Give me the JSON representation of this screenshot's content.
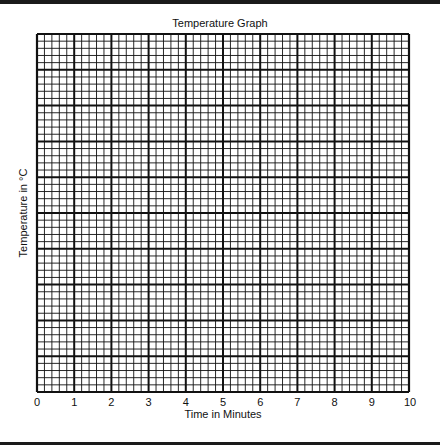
{
  "chart_data": {
    "type": "line",
    "title": "Temperature Graph",
    "xlabel": "Time in Minutes",
    "ylabel": "Temperature in °C",
    "x_ticks": [
      "0",
      "1",
      "2",
      "3",
      "4",
      "5",
      "6",
      "7",
      "8",
      "9",
      "10"
    ],
    "xlim": [
      0,
      10
    ],
    "y_ticks": [],
    "series": [],
    "grid": {
      "on": true,
      "minor_columns": 50,
      "minor_rows": 50,
      "major_every": 5
    },
    "legend": null
  },
  "colors": {
    "line": "#111111",
    "background": "#ffffff"
  }
}
